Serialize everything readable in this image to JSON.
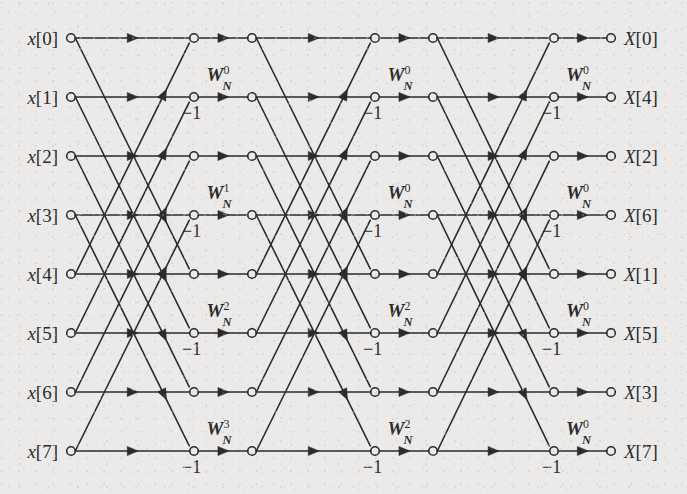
{
  "figure": {
    "kind": "fft-butterfly-signal-flow-graph",
    "title": "",
    "background_color": "#ebeae8",
    "line_color": "#2b2b2b",
    "node_fill": "#ebeae8",
    "radix": 2,
    "n_points": 8,
    "num_stages": 3
  },
  "geometry": {
    "rows_y": [
      38,
      97,
      156,
      215,
      274,
      333,
      392,
      451
    ],
    "input_node_x": 71,
    "output_node_x": 611,
    "stage_columns": [
      {
        "butterfly_x": 194,
        "multiply_x": 252
      },
      {
        "butterfly_x": 375,
        "multiply_x": 433
      },
      {
        "butterfly_x": 554,
        "multiply_x": 611
      }
    ]
  },
  "inputs": [
    {
      "label": "x[0]",
      "var": "x",
      "index": "[0]",
      "row": 0
    },
    {
      "label": "x[1]",
      "var": "x",
      "index": "[1]",
      "row": 1
    },
    {
      "label": "x[2]",
      "var": "x",
      "index": "[2]",
      "row": 2
    },
    {
      "label": "x[3]",
      "var": "x",
      "index": "[3]",
      "row": 3
    },
    {
      "label": "x[4]",
      "var": "x",
      "index": "[4]",
      "row": 4
    },
    {
      "label": "x[5]",
      "var": "x",
      "index": "[5]",
      "row": 5
    },
    {
      "label": "x[6]",
      "var": "x",
      "index": "[6]",
      "row": 6
    },
    {
      "label": "x[7]",
      "var": "x",
      "index": "[7]",
      "row": 7
    }
  ],
  "outputs": [
    {
      "label": "X[0]",
      "var": "X",
      "index": "[0]",
      "row": 0
    },
    {
      "label": "X[4]",
      "var": "X",
      "index": "[4]",
      "row": 1
    },
    {
      "label": "X[2]",
      "var": "X",
      "index": "[2]",
      "row": 2
    },
    {
      "label": "X[6]",
      "var": "X",
      "index": "[6]",
      "row": 3
    },
    {
      "label": "X[1]",
      "var": "X",
      "index": "[1]",
      "row": 4
    },
    {
      "label": "X[5]",
      "var": "X",
      "index": "[5]",
      "row": 5
    },
    {
      "label": "X[3]",
      "var": "X",
      "index": "[3]",
      "row": 6
    },
    {
      "label": "X[7]",
      "var": "X",
      "index": "[7]",
      "row": 7
    }
  ],
  "twiddles": [
    {
      "stage": 1,
      "row": 1,
      "base": "W",
      "sub": "N",
      "sup": "0",
      "text": "W_N^0"
    },
    {
      "stage": 1,
      "row": 3,
      "base": "W",
      "sub": "N",
      "sup": "1",
      "text": "W_N^1"
    },
    {
      "stage": 1,
      "row": 5,
      "base": "W",
      "sub": "N",
      "sup": "2",
      "text": "W_N^2"
    },
    {
      "stage": 1,
      "row": 7,
      "base": "W",
      "sub": "N",
      "sup": "3",
      "text": "W_N^3"
    },
    {
      "stage": 2,
      "row": 1,
      "base": "W",
      "sub": "N",
      "sup": "0",
      "text": "W_N^0"
    },
    {
      "stage": 2,
      "row": 3,
      "base": "W",
      "sub": "N",
      "sup": "0",
      "text": "W_N^0"
    },
    {
      "stage": 2,
      "row": 5,
      "base": "W",
      "sub": "N",
      "sup": "2",
      "text": "W_N^2"
    },
    {
      "stage": 2,
      "row": 7,
      "base": "W",
      "sub": "N",
      "sup": "2",
      "text": "W_N^2"
    },
    {
      "stage": 3,
      "row": 1,
      "base": "W",
      "sub": "N",
      "sup": "0",
      "text": "W_N^0"
    },
    {
      "stage": 3,
      "row": 3,
      "base": "W",
      "sub": "N",
      "sup": "0",
      "text": "W_N^0"
    },
    {
      "stage": 3,
      "row": 5,
      "base": "W",
      "sub": "N",
      "sup": "0",
      "text": "W_N^0"
    },
    {
      "stage": 3,
      "row": 7,
      "base": "W",
      "sub": "N",
      "sup": "0",
      "text": "W_N^0"
    }
  ],
  "minus_one_labels": [
    {
      "stage": 1,
      "row": 1,
      "text": "−1"
    },
    {
      "stage": 1,
      "row": 3,
      "text": "−1"
    },
    {
      "stage": 1,
      "row": 5,
      "text": "−1"
    },
    {
      "stage": 1,
      "row": 7,
      "text": "−1"
    },
    {
      "stage": 2,
      "row": 1,
      "text": "−1"
    },
    {
      "stage": 2,
      "row": 3,
      "text": "−1"
    },
    {
      "stage": 2,
      "row": 5,
      "text": "−1"
    },
    {
      "stage": 2,
      "row": 7,
      "text": "−1"
    },
    {
      "stage": 3,
      "row": 1,
      "text": "−1"
    },
    {
      "stage": 3,
      "row": 3,
      "text": "−1"
    },
    {
      "stage": 3,
      "row": 5,
      "text": "−1"
    },
    {
      "stage": 3,
      "row": 7,
      "text": "−1"
    }
  ],
  "butterfly_pairs": {
    "span": 4,
    "note": "each stage pairs row r with row r+4 for r in 0..3; top output at r, bottom (negated) output at r+4",
    "pairs": [
      [
        0,
        4
      ],
      [
        1,
        5
      ],
      [
        2,
        6
      ],
      [
        3,
        7
      ]
    ]
  }
}
